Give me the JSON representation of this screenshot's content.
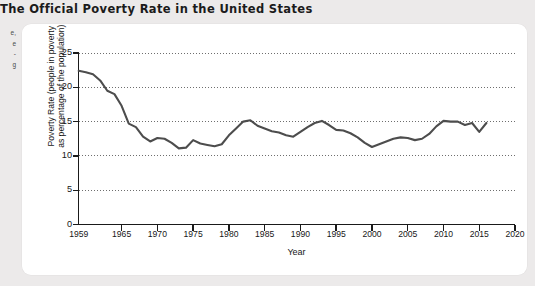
{
  "figure": {
    "title": "The Official Poverty Rate in the United States"
  },
  "margin_notes": {
    "lines": [
      "e,",
      "e",
      "-",
      "g"
    ]
  },
  "chart_data": {
    "type": "line",
    "title": "The Official Poverty Rate in the United States",
    "xlabel": "Year",
    "ylabel": "Poverty Rate (people in poverty as percentage of the population)",
    "ylabel_line1": "Poverty Rate (people in poverty",
    "ylabel_line2": "as percentage of the population)",
    "xlim": [
      1959,
      2020
    ],
    "ylim": [
      0,
      25
    ],
    "yticks": [
      0,
      5,
      10,
      15,
      20,
      25
    ],
    "xticks": [
      1959,
      1965,
      1970,
      1975,
      1980,
      1985,
      1990,
      1995,
      2000,
      2005,
      2010,
      2015,
      2020
    ],
    "grid": "horizontal-dotted",
    "legend": "none",
    "line_color": "#4d4d4d",
    "series": [
      {
        "name": "Official poverty rate",
        "x": [
          1959,
          1960,
          1961,
          1962,
          1963,
          1964,
          1965,
          1966,
          1967,
          1968,
          1969,
          1970,
          1971,
          1972,
          1973,
          1974,
          1975,
          1976,
          1977,
          1978,
          1979,
          1980,
          1981,
          1982,
          1983,
          1984,
          1985,
          1986,
          1987,
          1988,
          1989,
          1990,
          1991,
          1992,
          1993,
          1994,
          1995,
          1996,
          1997,
          1998,
          1999,
          2000,
          2001,
          2002,
          2003,
          2004,
          2005,
          2006,
          2007,
          2008,
          2009,
          2010,
          2011,
          2012,
          2013,
          2014,
          2015,
          2016
        ],
        "values": [
          22.4,
          22.2,
          21.9,
          21.0,
          19.5,
          19.0,
          17.3,
          14.7,
          14.2,
          12.8,
          12.1,
          12.6,
          12.5,
          11.9,
          11.1,
          11.2,
          12.3,
          11.8,
          11.6,
          11.4,
          11.7,
          13.0,
          14.0,
          15.0,
          15.2,
          14.4,
          14.0,
          13.6,
          13.4,
          13.0,
          12.8,
          13.5,
          14.2,
          14.8,
          15.1,
          14.5,
          13.8,
          13.7,
          13.3,
          12.7,
          11.9,
          11.3,
          11.7,
          12.1,
          12.5,
          12.7,
          12.6,
          12.3,
          12.5,
          13.2,
          14.3,
          15.1,
          15.0,
          15.0,
          14.5,
          14.8,
          13.5,
          14.8
        ]
      }
    ]
  }
}
